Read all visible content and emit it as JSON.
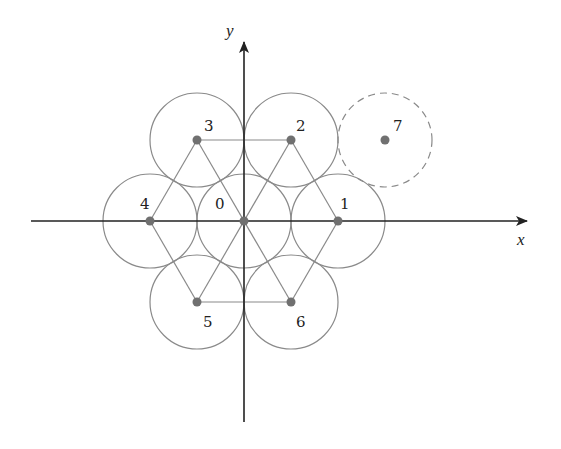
{
  "diagram": {
    "type": "hexagonal circle packing on coordinate axes",
    "origin_px": [
      244,
      221
    ],
    "radius_px": 47,
    "spacing_px": 94,
    "axes": {
      "x": {
        "label": "x",
        "from": [
          31,
          221
        ],
        "to": [
          527,
          221
        ]
      },
      "y": {
        "label": "y",
        "from": [
          244,
          422
        ],
        "to": [
          244,
          42
        ]
      }
    },
    "points": [
      {
        "id": "0",
        "label": "0",
        "cx": 244,
        "cy": 221,
        "lx": 215,
        "ly": 209,
        "dashed": false
      },
      {
        "id": "1",
        "label": "1",
        "cx": 338,
        "cy": 221,
        "lx": 340,
        "ly": 209,
        "dashed": false
      },
      {
        "id": "2",
        "label": "2",
        "cx": 291,
        "cy": 140,
        "lx": 296,
        "ly": 131,
        "dashed": false
      },
      {
        "id": "3",
        "label": "3",
        "cx": 197,
        "cy": 140,
        "lx": 204,
        "ly": 131,
        "dashed": false
      },
      {
        "id": "4",
        "label": "4",
        "cx": 150,
        "cy": 221,
        "lx": 140,
        "ly": 209,
        "dashed": false
      },
      {
        "id": "5",
        "label": "5",
        "cx": 197,
        "cy": 302,
        "lx": 203,
        "ly": 327,
        "dashed": false
      },
      {
        "id": "6",
        "label": "6",
        "cx": 291,
        "cy": 302,
        "lx": 296,
        "ly": 327,
        "dashed": false
      },
      {
        "id": "7",
        "label": "7",
        "cx": 385,
        "cy": 140,
        "lx": 393,
        "ly": 131,
        "dashed": true
      }
    ],
    "edges": [
      [
        "3",
        "2"
      ],
      [
        "5",
        "6"
      ],
      [
        "3",
        "4"
      ],
      [
        "4",
        "5"
      ],
      [
        "2",
        "1"
      ],
      [
        "1",
        "6"
      ],
      [
        "3",
        "6"
      ],
      [
        "2",
        "5"
      ]
    ],
    "colors": {
      "circle": "#8a8a8a",
      "point": "#707070",
      "edge": "#8a8a8a",
      "axis": "#222222"
    }
  }
}
